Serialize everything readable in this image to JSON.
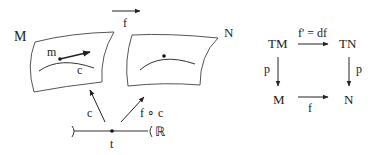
{
  "figure": {
    "left": {
      "manifold_M_label": "M",
      "manifold_N_label": "N",
      "map_label": "f",
      "point_label": "m",
      "curve_label": "c",
      "curve_arrow_label": "c",
      "composite_arrow_label": "f ∘ c",
      "interval_param_label": "t",
      "reals_label": "ℝ"
    },
    "commutative_diagram": {
      "top_left": "TM",
      "top_right": "TN",
      "bottom_left": "M",
      "bottom_right": "N",
      "top_arrow_label": "f' = df",
      "bottom_arrow_label": "f",
      "left_arrow_label": "p",
      "right_arrow_label": "p"
    }
  }
}
